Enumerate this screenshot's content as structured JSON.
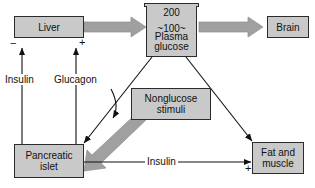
{
  "figure": {
    "background_color": "#ffffff",
    "box_fill_color": "#c9c9c9",
    "box_border_color": "#2b2b2b",
    "thick_arrow_color": "#a0a0a0",
    "thin_arrow_color": "#111111"
  },
  "nodes": {
    "liver": {
      "label": "Liver"
    },
    "brain": {
      "label": "Brain"
    },
    "pancreatic_islet": {
      "label": "Pancreatic\nislet",
      "line1": "Pancreatic",
      "line2": "islet"
    },
    "fat_muscle": {
      "label": "Fat and\nmuscle",
      "line1": "Fat and",
      "line2": "muscle"
    },
    "nonglucose_stimuli": {
      "label": "Nonglucose\nstimuli",
      "line1": "Nonglucose",
      "line2": "stimuli"
    },
    "plasma_glucose": {
      "top_value": "200",
      "mid_value": "~100~",
      "label_line1": "Plasma",
      "label_line2": "glucose"
    }
  },
  "edges": {
    "insulin_to_liver": {
      "label": "Insulin",
      "sign": "−"
    },
    "glucagon_to_liver": {
      "label": "Glucagon",
      "sign": "+"
    },
    "insulin_to_fat_muscle": {
      "label": "Insulin",
      "sign": "+"
    }
  }
}
